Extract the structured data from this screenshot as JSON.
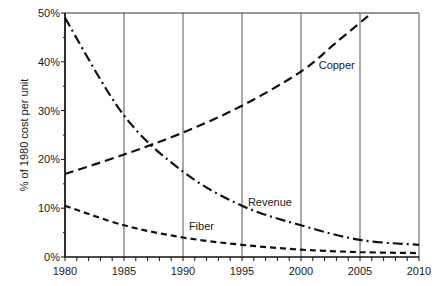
{
  "chart_data": {
    "type": "line",
    "title": "",
    "xlabel": "",
    "ylabel": "% of 1980 cost per unit",
    "xlim": [
      1980,
      2010
    ],
    "ylim": [
      0,
      50
    ],
    "grid": {
      "vertical": true,
      "horizontal": false
    },
    "legend": "inline labels",
    "x_ticks": [
      "1980",
      "1985",
      "1990",
      "1995",
      "2000",
      "2005",
      "2010"
    ],
    "y_ticks": [
      "0%",
      "10%",
      "20%",
      "30%",
      "40%",
      "50%"
    ],
    "series": [
      {
        "name": "Copper",
        "line_style": "long-dash",
        "x": [
          1980,
          1985,
          1990,
          1995,
          2000,
          2003,
          2006
        ],
        "values": [
          17,
          21,
          25.5,
          31,
          38,
          44,
          50
        ]
      },
      {
        "name": "Revenue",
        "line_style": "dash-dot",
        "x": [
          1980,
          1985,
          1990,
          1995,
          2000,
          2005,
          2010
        ],
        "values": [
          49,
          29,
          17.5,
          10.5,
          6.5,
          3.5,
          2.5
        ]
      },
      {
        "name": "Fiber",
        "line_style": "short-dash",
        "x": [
          1980,
          1985,
          1990,
          1995,
          2000,
          2005,
          2010
        ],
        "values": [
          10.5,
          6.5,
          4,
          2.5,
          1.5,
          1,
          0.8
        ]
      }
    ],
    "annotations": [
      {
        "text": "Copper",
        "x": 2001.5,
        "y": 38.5
      },
      {
        "text": "Revenue",
        "x": 1995.5,
        "y": 10.5
      },
      {
        "text": "Fiber",
        "x": 1990.5,
        "y": 5.5
      }
    ]
  }
}
